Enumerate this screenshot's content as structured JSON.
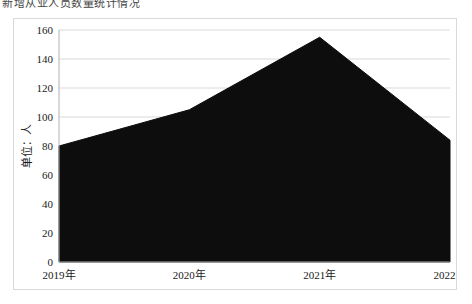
{
  "caption": "新增从业人员数量统计情况",
  "chart_data": {
    "type": "area",
    "title": "",
    "subtitle": "",
    "xlabel": "",
    "ylabel": "单位：人",
    "categories": [
      "2019年",
      "2020年",
      "2021年",
      "2022年"
    ],
    "series": [
      {
        "name": "",
        "values": [
          80,
          105,
          155,
          84
        ]
      }
    ],
    "ylim": [
      0,
      160
    ],
    "yticks": [
      0,
      20,
      40,
      60,
      80,
      100,
      120,
      140,
      160
    ],
    "ytick_labels": [
      "0",
      "20",
      "40",
      "60",
      "80",
      "100",
      "120",
      "140",
      "160"
    ],
    "grid": true,
    "grid_axis": "y",
    "legend": false,
    "legend_position": "none",
    "colors": {
      "area_fill": "#0d0d0d",
      "gridline": "#d9d9d9",
      "axis": "#b0b0b0",
      "frame_border": "#d9d9d9",
      "text": "#1a1a1a",
      "background": "#ffffff"
    }
  }
}
